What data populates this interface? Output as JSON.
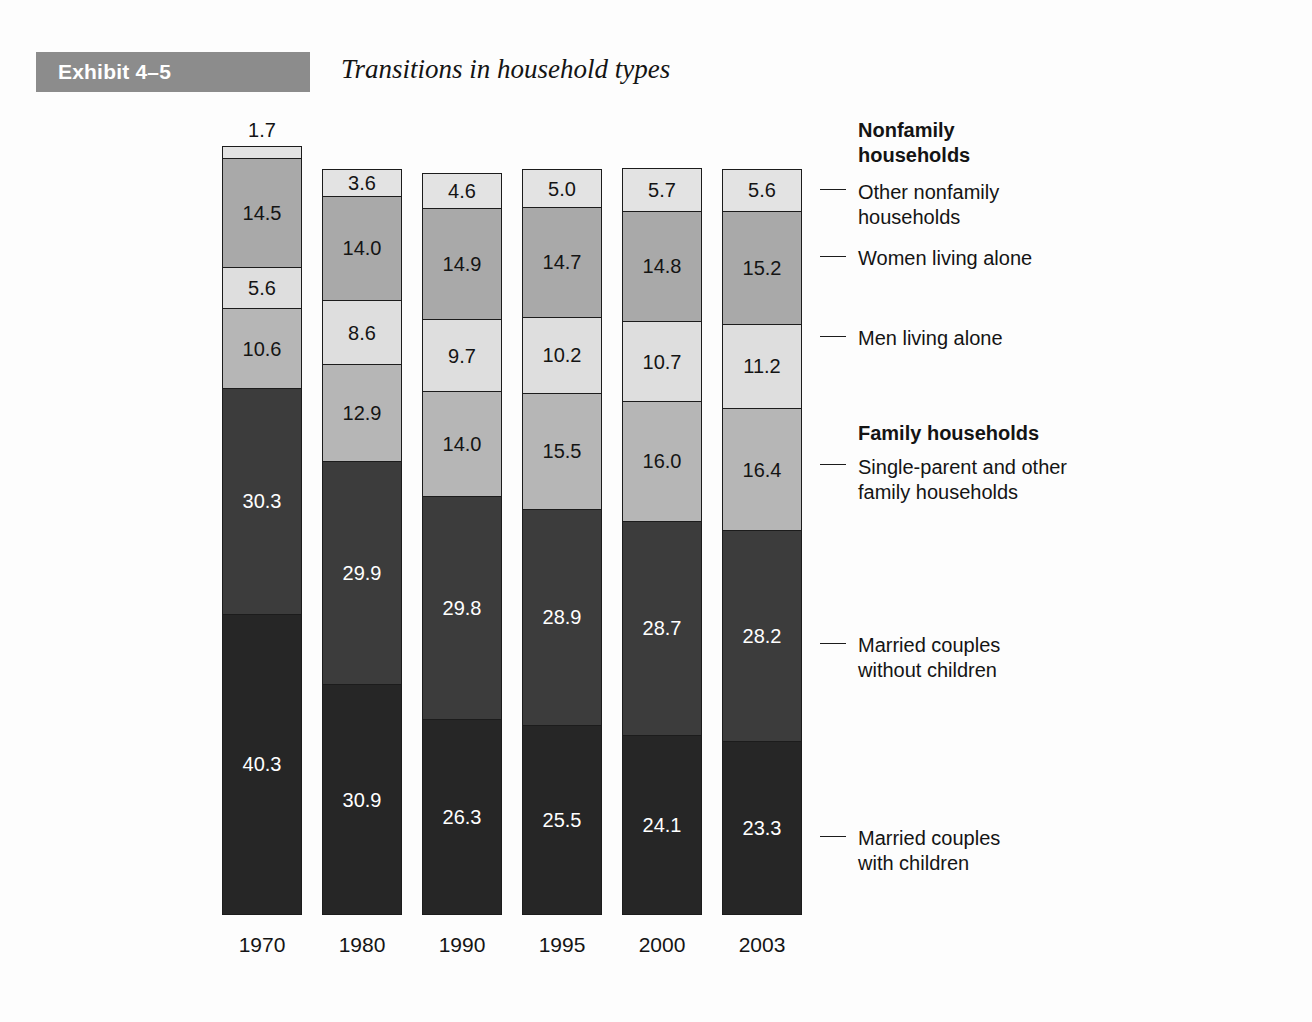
{
  "exhibit": {
    "banner_label": "Exhibit 4–5",
    "title": "Transitions in household types",
    "banner_color": "#8c8c8c"
  },
  "chart_data": {
    "type": "bar",
    "subtype": "stacked-100-percent-column",
    "title": "Transitions in household types",
    "xlabel": "",
    "ylabel": "",
    "ylim": [
      0,
      100
    ],
    "grid": false,
    "legend_position": "right",
    "categories": [
      "1970",
      "1980",
      "1990",
      "1995",
      "2000",
      "2003"
    ],
    "stack_order_bottom_to_top": [
      "Married couples with children",
      "Married couples without children",
      "Single-parent and other family households",
      "Men living alone",
      "Women living alone",
      "Other nonfamily households"
    ],
    "series": [
      {
        "name": "Married couples with children",
        "group": "Family households",
        "color": "#262626",
        "text_color": "#ffffff",
        "values": [
          40.3,
          30.9,
          26.3,
          25.5,
          24.1,
          23.3
        ],
        "labels": [
          "40.3",
          "30.9",
          "26.3",
          "25.5",
          "24.1",
          "23.3"
        ]
      },
      {
        "name": "Married couples without children",
        "group": "Family households",
        "color": "#3c3c3c",
        "text_color": "#ffffff",
        "values": [
          30.3,
          29.9,
          29.8,
          28.9,
          28.7,
          28.2
        ],
        "labels": [
          "30.3",
          "29.9",
          "29.8",
          "28.9",
          "28.7",
          "28.2"
        ]
      },
      {
        "name": "Single-parent and other family households",
        "group": "Family households",
        "color": "#b6b6b6",
        "text_color": "#141414",
        "values": [
          10.6,
          12.9,
          14.0,
          15.5,
          16.0,
          16.4
        ],
        "labels": [
          "10.6",
          "12.9",
          "14.0",
          "15.5",
          "16.0",
          "16.4"
        ]
      },
      {
        "name": "Men living alone",
        "group": "Nonfamily households",
        "color": "#dedede",
        "text_color": "#141414",
        "values": [
          5.6,
          8.6,
          9.7,
          10.2,
          10.7,
          11.2
        ],
        "labels": [
          "5.6",
          "8.6",
          "9.7",
          "10.2",
          "10.7",
          "11.2"
        ]
      },
      {
        "name": "Women living alone",
        "group": "Nonfamily households",
        "color": "#a9a9a9",
        "text_color": "#141414",
        "values": [
          14.5,
          14.0,
          14.9,
          14.7,
          14.8,
          15.2
        ],
        "labels": [
          "14.5",
          "14.0",
          "14.9",
          "14.7",
          "14.8",
          "15.2"
        ]
      },
      {
        "name": "Other nonfamily households",
        "group": "Nonfamily households",
        "color": "#e3e3e3",
        "text_color": "#141414",
        "values": [
          1.7,
          3.6,
          4.6,
          5.0,
          5.7,
          5.6
        ],
        "labels": [
          "1.7",
          "3.6",
          "4.6",
          "5.0",
          "5.7",
          "5.6"
        ]
      }
    ]
  },
  "legend": {
    "entries": [
      {
        "key": "nonfamily-heading",
        "text": "Nonfamily\nhouseholds",
        "heading": true,
        "tick": false,
        "top": 118,
        "tick_y": 0
      },
      {
        "key": "other-nonfamily",
        "text": "Other nonfamily\nhouseholds",
        "heading": false,
        "tick": true,
        "top": 180,
        "tick_y": 189
      },
      {
        "key": "women-alone",
        "text": "Women living alone",
        "heading": false,
        "tick": true,
        "top": 246,
        "tick_y": 256
      },
      {
        "key": "men-alone",
        "text": "Men living alone",
        "heading": false,
        "tick": true,
        "top": 326,
        "tick_y": 336
      },
      {
        "key": "family-heading",
        "text": "Family households",
        "heading": true,
        "tick": false,
        "top": 421,
        "tick_y": 0
      },
      {
        "key": "single-parent",
        "text": "Single-parent and other\nfamily households",
        "heading": false,
        "tick": true,
        "top": 455,
        "tick_y": 464
      },
      {
        "key": "married-without",
        "text": "Married couples\nwithout children",
        "heading": false,
        "tick": true,
        "top": 633,
        "tick_y": 643
      },
      {
        "key": "married-with",
        "text": "Married couples\nwith children",
        "heading": false,
        "tick": true,
        "top": 826,
        "tick_y": 836
      }
    ]
  }
}
